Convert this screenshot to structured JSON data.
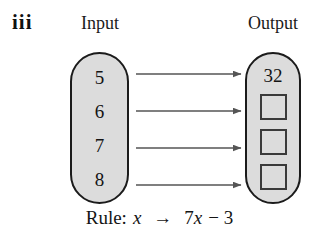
{
  "figure": {
    "item_label": "iii",
    "headings": {
      "input": "Input",
      "output": "Output"
    },
    "input_machine": {
      "values": [
        "5",
        "6",
        "7",
        "8"
      ]
    },
    "output_machine": {
      "items": [
        {
          "kind": "value",
          "text": "32"
        },
        {
          "kind": "blank",
          "text": ""
        },
        {
          "kind": "blank",
          "text": ""
        },
        {
          "kind": "blank",
          "text": ""
        }
      ]
    },
    "arrows": {
      "count": 4,
      "color": "#555555"
    },
    "rule": {
      "prefix": "Rule:",
      "input_variable": "x",
      "maps_to": "→",
      "expression_coefficient": "7",
      "expression_variable": "x",
      "expression_constant": "− 3",
      "full_text": "Rule: x → 7x − 3"
    },
    "colors": {
      "capsule_fill": "#dcdcdc",
      "capsule_border": "#1b1b1b",
      "box_border": "#3a3a3a",
      "arrow": "#555555",
      "text": "#141414",
      "background": "#ffffff"
    }
  }
}
